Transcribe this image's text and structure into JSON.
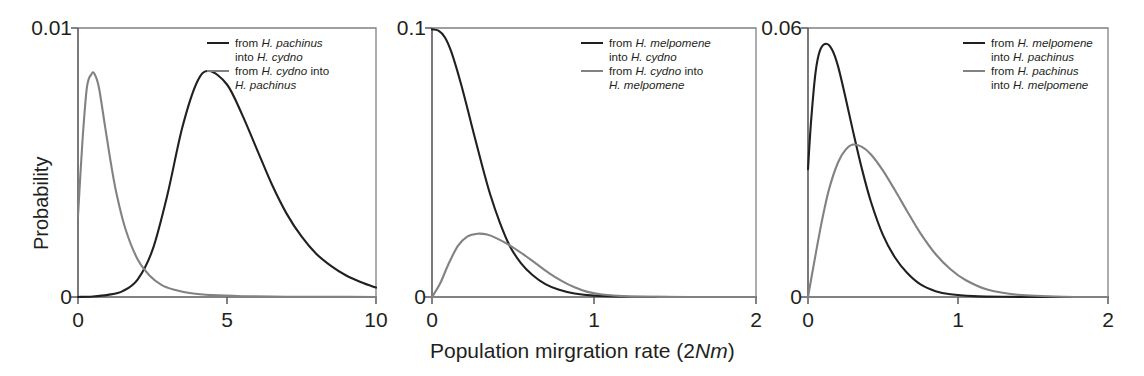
{
  "figure": {
    "background": "#ffffff",
    "curve_colors": {
      "black": "#231f20",
      "gray": "#808285"
    },
    "axis_color": "#58595b",
    "xlabel_prefix": "Population mirgration rate (2",
    "xlabel_italic": "Nm",
    "xlabel_suffix": ")",
    "ylabel": "Probability"
  },
  "chart_data": [
    {
      "type": "line",
      "panel": "a",
      "title": "",
      "xlabel": "Population mirgration rate (2Nm)",
      "ylabel": "Probability",
      "xlim": [
        0,
        10
      ],
      "ylim": [
        0,
        0.01
      ],
      "xticks": [
        0,
        5,
        10
      ],
      "xticklabels": [
        "0",
        "5",
        "10"
      ],
      "yticks": [
        0,
        0.01
      ],
      "yticklabels": [
        "0",
        "0.01"
      ],
      "grid": false,
      "legend_position": "top-right",
      "series": [
        {
          "name": "from H. pachinus into H. cydno",
          "color": "#231f20",
          "style": "black",
          "legend_line1_plain": "from ",
          "legend_line1_italic": "H. pachinus",
          "legend_line2_plain": "into ",
          "legend_line2_italic": "H. cydno",
          "peak_x": 4.4,
          "peak_y": 0.0084,
          "x": [
            0.0,
            0.5,
            1.0,
            1.5,
            2.0,
            2.5,
            3.0,
            3.5,
            4.0,
            4.4,
            5.0,
            5.5,
            6.0,
            6.5,
            7.0,
            7.5,
            8.0,
            8.5,
            9.0,
            9.5,
            10.0
          ],
          "y": [
            0.0,
            2e-05,
            8e-05,
            0.00022,
            0.00065,
            0.00175,
            0.0038,
            0.0063,
            0.008,
            0.0084,
            0.0079,
            0.0068,
            0.0055,
            0.0042,
            0.0031,
            0.00225,
            0.0016,
            0.00115,
            0.0008,
            0.00055,
            0.00035
          ]
        },
        {
          "name": "from H. cydno into H. pachinus",
          "color": "#808285",
          "style": "gray",
          "legend_line1_plain": "from ",
          "legend_line1_italic": "H. cydno",
          "legend_line1_tail": " into",
          "legend_line2_italic": "H. pachinus",
          "peak_x": 0.55,
          "peak_y": 0.0083,
          "x": [
            0.0,
            0.15,
            0.3,
            0.45,
            0.55,
            0.7,
            0.9,
            1.1,
            1.3,
            1.6,
            2.0,
            2.4,
            2.8,
            3.2,
            3.8,
            4.5,
            5.5,
            7.0,
            8.5,
            10.0
          ],
          "y": [
            0.003,
            0.0058,
            0.0078,
            0.00828,
            0.0083,
            0.0078,
            0.0064,
            0.005,
            0.0038,
            0.0025,
            0.0014,
            0.0008,
            0.00045,
            0.00028,
            0.00014,
            7e-05,
            3e-05,
            1e-05,
            5e-06,
            0.0
          ]
        }
      ]
    },
    {
      "type": "line",
      "panel": "b",
      "title": "",
      "xlabel": "Population mirgration rate (2Nm)",
      "ylabel": "",
      "xlim": [
        0,
        2
      ],
      "ylim": [
        0,
        0.1
      ],
      "xticks": [
        0,
        1,
        2
      ],
      "xticklabels": [
        "0",
        "1",
        "2"
      ],
      "yticks": [
        0,
        0.1
      ],
      "yticklabels": [
        "0",
        "0.1"
      ],
      "grid": false,
      "legend_position": "top-right",
      "series": [
        {
          "name": "from H. melpomene into H. cydno",
          "color": "#231f20",
          "style": "black",
          "legend_line1_plain": "from ",
          "legend_line1_italic": "H. melpomene",
          "legend_line2_plain": "into ",
          "legend_line2_italic": "H. cydno",
          "peak_x": 0.0,
          "peak_y": 0.1,
          "x": [
            0.0,
            0.04,
            0.08,
            0.12,
            0.18,
            0.24,
            0.3,
            0.36,
            0.42,
            0.48,
            0.55,
            0.62,
            0.7,
            0.78,
            0.88,
            1.0,
            1.2,
            1.5,
            2.0
          ],
          "y": [
            0.0995,
            0.099,
            0.0965,
            0.091,
            0.079,
            0.065,
            0.051,
            0.038,
            0.0275,
            0.019,
            0.0125,
            0.0082,
            0.0048,
            0.0028,
            0.0013,
            0.0005,
            0.00012,
            2e-05,
            0.0
          ]
        },
        {
          "name": "from H. cydno into H. melpomene",
          "color": "#808285",
          "style": "gray",
          "legend_line1_plain": "from ",
          "legend_line1_italic": "H. cydno",
          "legend_line1_tail": " into",
          "legend_line2_italic": "H. melpomene",
          "peak_x": 0.28,
          "peak_y": 0.0235,
          "x": [
            0.0,
            0.05,
            0.1,
            0.16,
            0.22,
            0.28,
            0.34,
            0.4,
            0.48,
            0.56,
            0.64,
            0.72,
            0.8,
            0.88,
            0.96,
            1.05,
            1.2,
            1.4,
            1.7,
            2.0
          ],
          "y": [
            0.0,
            0.005,
            0.012,
            0.019,
            0.0225,
            0.0235,
            0.0232,
            0.0218,
            0.0192,
            0.016,
            0.0125,
            0.009,
            0.006,
            0.0036,
            0.0019,
            0.0009,
            0.00025,
            6e-05,
            1e-05,
            0.0
          ]
        }
      ]
    },
    {
      "type": "line",
      "panel": "c",
      "title": "",
      "xlabel": "Population mirgration rate (2Nm)",
      "ylabel": "",
      "xlim": [
        0,
        2
      ],
      "ylim": [
        0,
        0.06
      ],
      "xticks": [
        0,
        1,
        2
      ],
      "xticklabels": [
        "0",
        "1",
        "2"
      ],
      "yticks": [
        0,
        0.06
      ],
      "yticklabels": [
        "0",
        "0.06"
      ],
      "grid": false,
      "legend_position": "top-right",
      "series": [
        {
          "name": "from H. melpomene into H. pachinus",
          "color": "#231f20",
          "style": "black",
          "legend_line1_plain": "from ",
          "legend_line1_italic": "H. melpomene",
          "legend_line2_plain": "into ",
          "legend_line2_italic": "H. pachinus",
          "peak_x": 0.12,
          "peak_y": 0.0565,
          "x": [
            0.0,
            0.02,
            0.05,
            0.08,
            0.12,
            0.16,
            0.2,
            0.25,
            0.3,
            0.36,
            0.42,
            0.5,
            0.58,
            0.66,
            0.75,
            0.85,
            0.95,
            1.1,
            1.3,
            1.6,
            2.0
          ],
          "y": [
            0.0285,
            0.039,
            0.05,
            0.055,
            0.0565,
            0.0552,
            0.0515,
            0.0445,
            0.037,
            0.0285,
            0.0212,
            0.0138,
            0.0088,
            0.0054,
            0.0028,
            0.0013,
            0.0006,
            0.0002,
            5e-05,
            1e-05,
            0.0
          ]
        },
        {
          "name": "from H. pachinus into H. melpomene",
          "color": "#808285",
          "style": "gray",
          "legend_line1_plain": "from ",
          "legend_line1_italic": "H. pachinus",
          "legend_line2_plain": "into ",
          "legend_line2_italic": "H. melpomene",
          "peak_x": 0.3,
          "peak_y": 0.034,
          "x": [
            0.0,
            0.04,
            0.09,
            0.14,
            0.2,
            0.25,
            0.3,
            0.36,
            0.42,
            0.5,
            0.58,
            0.66,
            0.75,
            0.85,
            0.95,
            1.05,
            1.2,
            1.4,
            1.7,
            2.0
          ],
          "y": [
            0.0,
            0.0075,
            0.0165,
            0.024,
            0.03,
            0.0328,
            0.034,
            0.0335,
            0.0318,
            0.0282,
            0.0238,
            0.0192,
            0.0142,
            0.0096,
            0.0062,
            0.0038,
            0.0016,
            0.0005,
            5e-05,
            0.0
          ]
        }
      ]
    }
  ]
}
